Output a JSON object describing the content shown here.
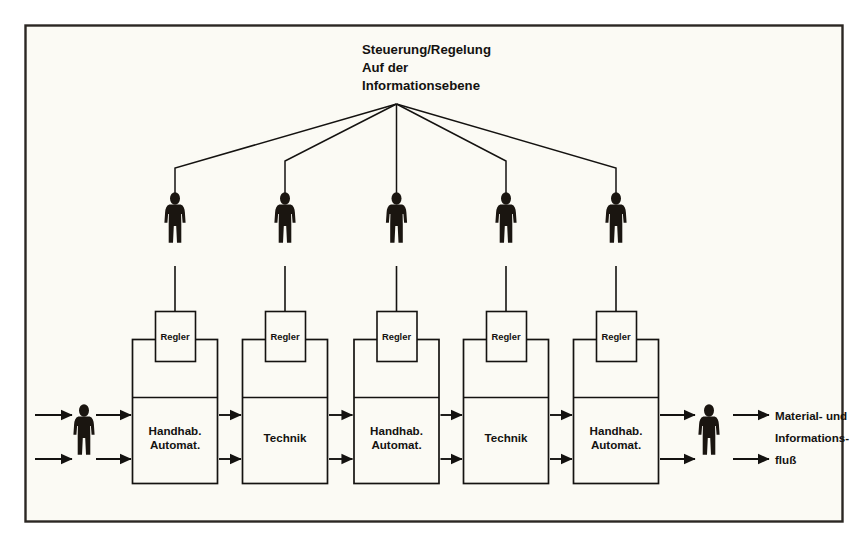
{
  "figure": {
    "title_lines": [
      "Steuerung/Regelung",
      "Auf der",
      "Informationsebene"
    ],
    "frame_color": "#2b2723",
    "background_color": "#fbfaf4",
    "line_color": "#141210",
    "person_color": "#1a1510"
  },
  "controllers": [
    {
      "label": "Regler"
    },
    {
      "label": "Regler"
    },
    {
      "label": "Regler"
    },
    {
      "label": "Regler"
    },
    {
      "label": "Regler"
    }
  ],
  "stations": [
    {
      "label_lines": [
        "Handhab.",
        "Automat."
      ]
    },
    {
      "label_lines": [
        "Technik"
      ]
    },
    {
      "label_lines": [
        "Handhab.",
        "Automat."
      ]
    },
    {
      "label_lines": [
        "Technik"
      ]
    },
    {
      "label_lines": [
        "Handhab.",
        "Automat."
      ]
    }
  ],
  "operators": [
    {
      "name": "operator-1"
    },
    {
      "name": "operator-2"
    },
    {
      "name": "operator-3"
    },
    {
      "name": "operator-4"
    },
    {
      "name": "operator-5"
    }
  ],
  "input_worker": {
    "name": "input-worker"
  },
  "output_worker": {
    "name": "output-worker"
  },
  "flow_legend": {
    "lines": [
      "Material- und",
      "Informations-",
      "fluß"
    ]
  }
}
